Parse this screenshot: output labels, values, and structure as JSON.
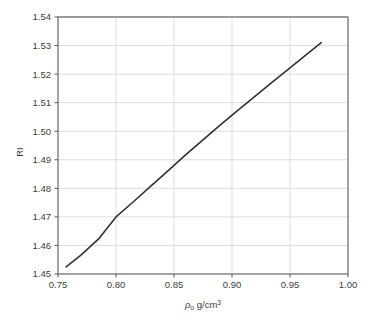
{
  "chart_data": {
    "type": "line",
    "title": "",
    "subtitle": "",
    "xlabel": "ρ₀ g/cm³",
    "xlabel_symbol": "ρ",
    "xlabel_subscript": "o",
    "xlabel_unit": "g/cm",
    "xlabel_superscript": "3",
    "ylabel": "RI",
    "xlim": [
      0.75,
      1.0
    ],
    "ylim": [
      1.45,
      1.54
    ],
    "xticks": [
      "0.75",
      "0.80",
      "0.85",
      "0.90",
      "0.95",
      "1.00"
    ],
    "xtick_values": [
      0.75,
      0.8,
      0.85,
      0.9,
      0.95,
      1.0
    ],
    "yticks": [
      "1.45",
      "1.46",
      "1.47",
      "1.48",
      "1.49",
      "1.50",
      "1.51",
      "1.52",
      "1.53",
      "1.54"
    ],
    "ytick_values": [
      1.45,
      1.46,
      1.47,
      1.48,
      1.49,
      1.5,
      1.51,
      1.52,
      1.53,
      1.54
    ],
    "grid": true,
    "legend": "none",
    "series": [
      {
        "name": "RI vs density",
        "color": "#333333",
        "line_width": 1.6,
        "x": [
          0.757,
          0.77,
          0.785,
          0.8,
          0.815,
          0.83,
          0.845,
          0.86,
          0.875,
          0.89,
          0.905,
          0.92,
          0.935,
          0.95,
          0.963,
          0.977
        ],
        "y": [
          1.4525,
          1.4567,
          1.4623,
          1.47,
          1.4753,
          1.4808,
          1.4862,
          1.4917,
          1.497,
          1.5022,
          1.5073,
          1.5123,
          1.5173,
          1.5222,
          1.5265,
          1.531
        ]
      }
    ],
    "colors": {
      "background": "#ffffff",
      "plot_background": "#ffffff",
      "frame": "#5a5a5a",
      "grid": "#d9d9d9",
      "text": "#3d3d3d",
      "line": "#333333"
    },
    "geometry": {
      "plot_left": 58,
      "plot_top": 17,
      "plot_right": 348,
      "plot_bottom": 274
    }
  }
}
